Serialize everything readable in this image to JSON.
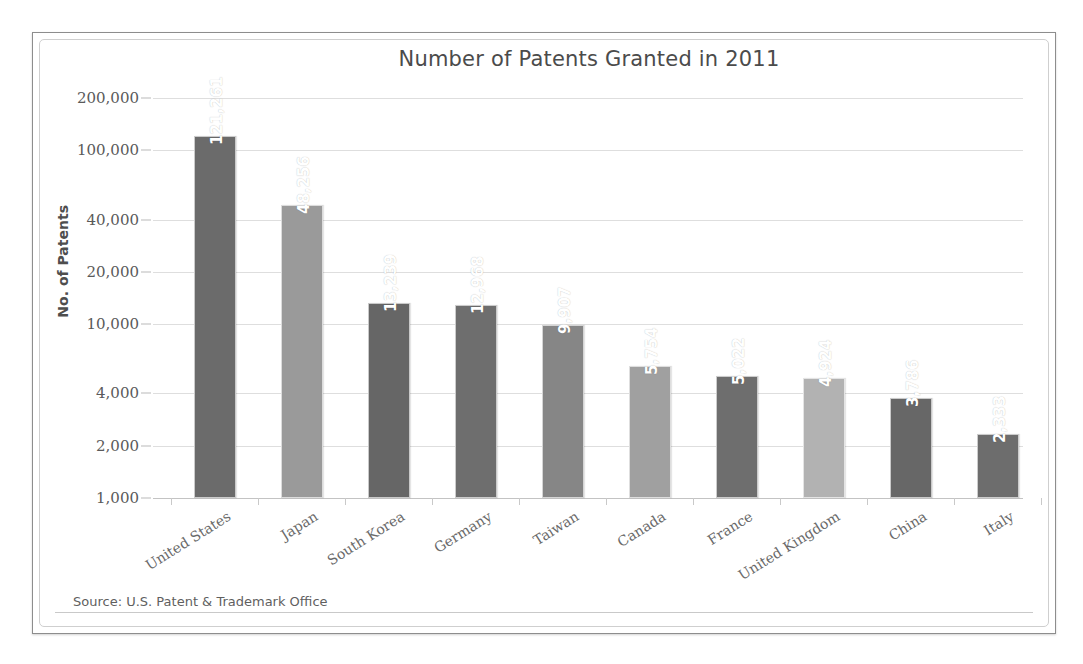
{
  "figure": {
    "title": "Number of Patents Granted in 2011",
    "y_axis_title": "No. of Patents",
    "source_note": "Source: U.S. Patent & Trademark Office",
    "frame_color": "#8d8d8d",
    "gridline_color": "#dedede",
    "bar_color_dark": "#6b6b6b",
    "bar_color_mid": "#8f8f8f",
    "bar_color_light": "#b0b0b0"
  },
  "chart_data": {
    "type": "bar",
    "title": "Number of Patents Granted in 2011",
    "xlabel": "",
    "ylabel": "No. of Patents",
    "yscale": "log",
    "ylim": [
      1000,
      200000
    ],
    "grid": true,
    "legend": "none",
    "ytick_labels": [
      "200,000",
      "100,000",
      "40,000",
      "20,000",
      "10,000",
      "4,000",
      "2,000",
      "1,000"
    ],
    "ytick_values": [
      200000,
      100000,
      40000,
      20000,
      10000,
      4000,
      2000,
      1000
    ],
    "categories": [
      "United States",
      "Japan",
      "South Korea",
      "Germany",
      "Taiwan",
      "Canada",
      "France",
      "United Kingdom",
      "China",
      "Italy"
    ],
    "values": [
      121261,
      48256,
      13239,
      12968,
      9907,
      5754,
      5022,
      4924,
      3786,
      2333
    ],
    "value_labels": [
      "121,261",
      "48,256",
      "13,239",
      "12,968",
      "9,907",
      "5,754",
      "5,022",
      "4,924",
      "3,786",
      "2,333"
    ],
    "bar_colors": [
      "#6b6b6b",
      "#9a9a9a",
      "#666666",
      "#6e6e6e",
      "#868686",
      "#a0a0a0",
      "#6e6e6e",
      "#b2b2b2",
      "#676767",
      "#6d6d6d"
    ],
    "annotations": [
      "Source: U.S. Patent & Trademark Office"
    ]
  }
}
